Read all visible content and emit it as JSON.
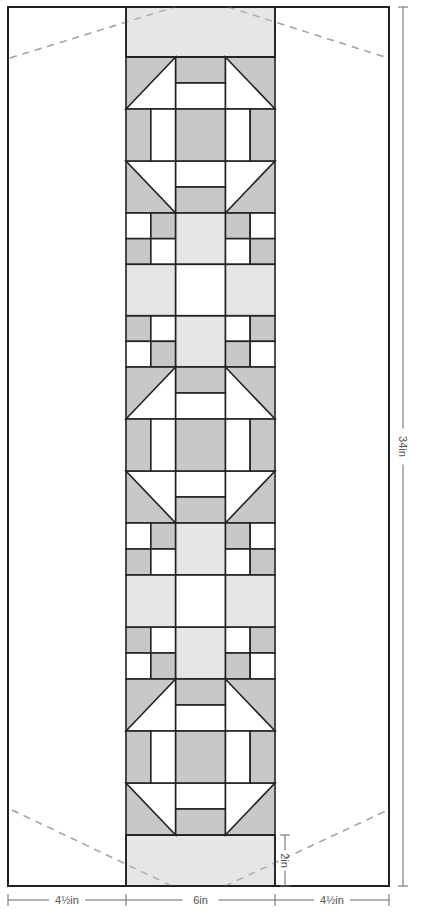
{
  "diagram": {
    "colors": {
      "dark": "#c8c8c8",
      "light": "#e6e6e6",
      "white": "#ffffff",
      "stroke": "#222222",
      "dash": "#aaaaaa",
      "dim": "#666666"
    },
    "frame": {
      "x": 8,
      "y": 7,
      "w": 381,
      "h": 879
    },
    "strip": {
      "x": 126,
      "w": 149
    },
    "top_border": {
      "y": 7,
      "h": 50
    },
    "bottom_border": {
      "y": 835,
      "h": 51
    },
    "blocks": [
      {
        "type": "churn-dash",
        "y": 57,
        "h": 156
      },
      {
        "type": "nine-patch",
        "y": 213,
        "h": 154
      },
      {
        "type": "churn-dash",
        "y": 367,
        "h": 156
      },
      {
        "type": "nine-patch",
        "y": 523,
        "h": 156
      },
      {
        "type": "churn-dash",
        "y": 679,
        "h": 156
      }
    ],
    "fold_lines": [
      {
        "x1": 10,
        "y1": 58,
        "x2": 175,
        "y2": 7
      },
      {
        "x1": 228,
        "y1": 7,
        "x2": 388,
        "y2": 58
      },
      {
        "x1": 12,
        "y1": 810,
        "x2": 172,
        "y2": 886
      },
      {
        "x1": 225,
        "y1": 886,
        "x2": 388,
        "y2": 810
      }
    ],
    "dimensions": {
      "left_width": "4½in",
      "center_width": "6in",
      "right_width": "4½in",
      "total_height": "34in",
      "border_height": "2in"
    }
  }
}
